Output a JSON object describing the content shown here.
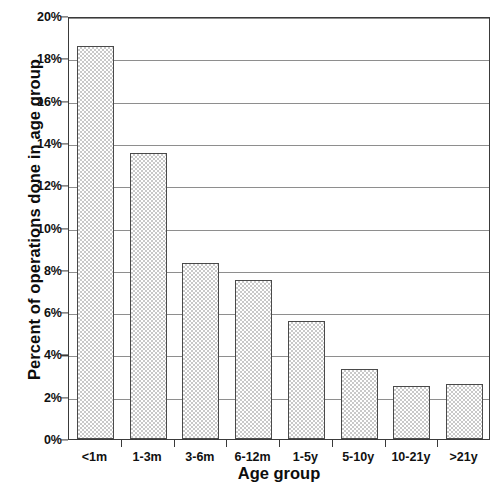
{
  "chart_data": {
    "type": "bar",
    "title": "",
    "xlabel": "Age group",
    "ylabel": "Percent of operations done in age group",
    "categories": [
      "<1m",
      "1-3m",
      "3-6m",
      "6-12m",
      "1-5y",
      "5-10y",
      "10-21y",
      ">21y"
    ],
    "values": [
      18.6,
      13.5,
      8.3,
      7.5,
      5.6,
      3.3,
      2.5,
      2.6
    ],
    "ylim": [
      0,
      20
    ],
    "ytick_values": [
      0,
      2,
      4,
      6,
      8,
      10,
      12,
      14,
      16,
      18,
      20
    ],
    "ytick_labels": [
      "0%",
      "2%",
      "4%",
      "6%",
      "8%",
      "10%",
      "12%",
      "14%",
      "16%",
      "18%",
      "20%"
    ],
    "value_unit": "%",
    "grid": true,
    "grid_axis": "y",
    "legend": false,
    "legend_position": "none",
    "bar_fill": "#fdfdfd",
    "bar_pattern": "checkered-stipple",
    "bar_edge_color": "#4a4a4a",
    "grid_color": "#8e8e8e",
    "axis_color": "#3a3a3a",
    "background": "#ffffff"
  }
}
